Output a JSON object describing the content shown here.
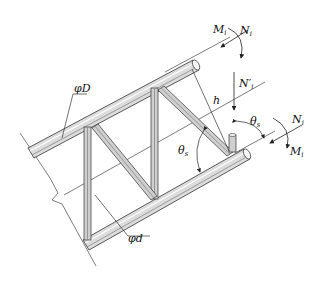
{
  "diagram": {
    "type": "truss-segment",
    "labels": {
      "chord_diameter": "φD",
      "web_diameter": "φd",
      "height": "h",
      "moment_top": "M",
      "moment_top_sub": "i",
      "axial_top": "N",
      "axial_top_sub": "i",
      "vertical_force": "N′",
      "vertical_force_sub": "i",
      "angle_right": "θ",
      "angle_right_sub": "s",
      "angle_left": "θ",
      "angle_left_sub": "s",
      "axial_bottom": "N",
      "axial_bottom_sub": "i",
      "moment_bottom": "M",
      "moment_bottom_sub": "i"
    },
    "colors": {
      "line": "#333333",
      "tube_fill": "#e6e6e6",
      "tube_shade": "#9a9a9a",
      "background": "#ffffff"
    }
  }
}
